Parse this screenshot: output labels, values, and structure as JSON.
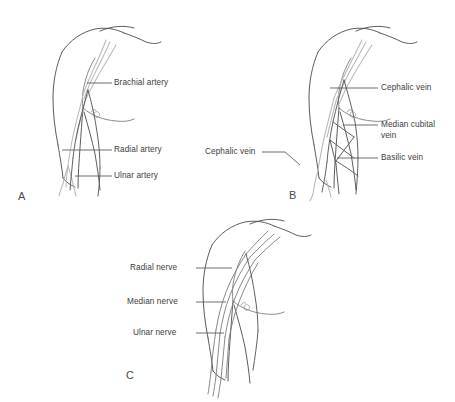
{
  "figure": {
    "background_color": "#ffffff",
    "line_color_outline": "#4a4a4a",
    "line_color_vessel_gray": "#b9b9b9",
    "line_color_vessel_dark": "#585858",
    "label_color": "#3c3c3c"
  },
  "panels": [
    {
      "id": "A",
      "letter": "A",
      "subject": "Arteries of the upper limb",
      "labels": [
        {
          "id": "brachial-artery",
          "text": "Brachial artery"
        },
        {
          "id": "radial-artery",
          "text": "Radial artery"
        },
        {
          "id": "ulnar-artery",
          "text": "Ulnar artery"
        }
      ]
    },
    {
      "id": "B",
      "letter": "B",
      "subject": "Superficial veins of the upper limb",
      "labels": [
        {
          "id": "cephalic-vein-upper",
          "text": "Cephalic vein"
        },
        {
          "id": "median-cubital-vein-line1",
          "text": "Median cubital"
        },
        {
          "id": "median-cubital-vein-line2",
          "text": "vein"
        },
        {
          "id": "basilic-vein",
          "text": "Basilic vein"
        },
        {
          "id": "cephalic-vein-lower",
          "text": "Cephalic vein"
        }
      ]
    },
    {
      "id": "C",
      "letter": "C",
      "subject": "Nerves of the upper limb",
      "labels": [
        {
          "id": "radial-nerve",
          "text": "Radial nerve"
        },
        {
          "id": "median-nerve",
          "text": "Median nerve"
        },
        {
          "id": "ulnar-nerve",
          "text": "Ulnar nerve"
        }
      ]
    }
  ]
}
